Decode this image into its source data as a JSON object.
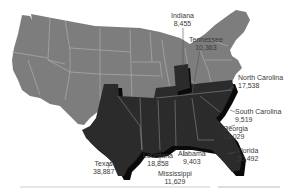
{
  "map": {
    "title": "",
    "colors": {
      "base_states": "#7d7d7d",
      "highlighted_states": "#2b2b2b",
      "shadow": "#0a0a0a",
      "borders": "#b5b5b5",
      "background": "#ffffff",
      "label_text": "#3a3a3a"
    },
    "highlighted": [
      {
        "state": "Indiana",
        "value": "8,455"
      },
      {
        "state": "Tennessee",
        "value": "10,363"
      },
      {
        "state": "North Carolina",
        "value": "17,538"
      },
      {
        "state": "South Carolina",
        "value": "9,519"
      },
      {
        "state": "Georgia",
        "value": "14,029"
      },
      {
        "state": "Florida",
        "value": "30,492"
      },
      {
        "state": "Alabama",
        "value": "9,403"
      },
      {
        "state": "Mississippi",
        "value": "11,629"
      },
      {
        "state": "Louisiana",
        "value": "18,858"
      },
      {
        "state": "Texas",
        "value": "38,887"
      }
    ]
  },
  "labels": {
    "indiana": {
      "name": "Indiana",
      "value": "8,455"
    },
    "tennessee": {
      "name": "Tennessee",
      "value": "10,363"
    },
    "north_carolina": {
      "name": "North Carolina",
      "value": "17,538"
    },
    "south_carolina": {
      "name": "South Carolina",
      "value": "9,519"
    },
    "georgia": {
      "name": "Georgia",
      "value": "14,029"
    },
    "florida": {
      "name": "Florida",
      "value": "30,492"
    },
    "alabama": {
      "name": "Alabama",
      "value": "9,403"
    },
    "mississippi": {
      "name": "Mississippi",
      "value": "11,629"
    },
    "louisiana": {
      "name": "Louisiana",
      "value": "18,858"
    },
    "texas": {
      "name": "Texas",
      "value": "38,887"
    }
  }
}
